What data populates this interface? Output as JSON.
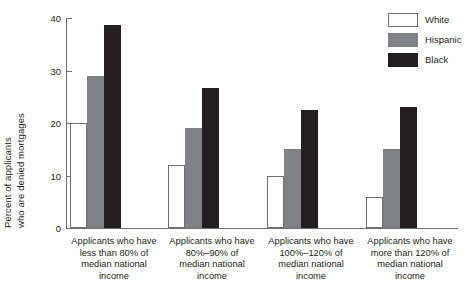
{
  "chart_data": {
    "type": "bar",
    "title": "",
    "subtitle": "",
    "xlabel": "",
    "ylabel": "Percent of applicants who are denied mortgages",
    "ylabel_lines": [
      "Percent of applicants",
      "who are denied mortgages"
    ],
    "ylim": [
      0,
      40
    ],
    "yticks": [
      0,
      10,
      20,
      30,
      40
    ],
    "ytick_labels": [
      "0",
      "10",
      "20",
      "30",
      "40"
    ],
    "grid": false,
    "legend_position": "top-right",
    "categories": [
      "Applicants who have less than 80% of median national income",
      "Applicants who have 80%–90% of median national income",
      "Applicants who have 100%–120% of median national income",
      "Applicants who have more than 120% of median national income"
    ],
    "category_label_lines": [
      [
        "Applicants who have",
        "less than 80% of",
        "median national",
        "income"
      ],
      [
        "Applicants who have",
        "80%–90% of",
        "median national",
        "income"
      ],
      [
        "Applicants who have",
        "100%–120% of",
        "median national",
        "income"
      ],
      [
        "Applicants who have",
        "more than 120% of",
        "median national",
        "income"
      ]
    ],
    "series": [
      {
        "name": "White",
        "color": "#ffffff",
        "border": "#6d6e71",
        "values": [
          20,
          12,
          10,
          6
        ]
      },
      {
        "name": "Hispanic",
        "color": "#808184",
        "border": "#808184",
        "values": [
          29,
          19,
          15,
          15
        ]
      },
      {
        "name": "Black",
        "color": "#231f20",
        "border": "#231f20",
        "values": [
          38.6,
          26.7,
          22.4,
          23
        ]
      }
    ]
  },
  "legend": {
    "items": [
      {
        "label": "White",
        "swatch": "white"
      },
      {
        "label": "Hispanic",
        "swatch": "hispanic"
      },
      {
        "label": "Black",
        "swatch": "black"
      }
    ]
  },
  "colors": {
    "axis": "#6d6e71",
    "text": "#231f20",
    "white_series": "#ffffff",
    "hispanic_series": "#808184",
    "black_series": "#231f20",
    "background": "#ffffff"
  }
}
